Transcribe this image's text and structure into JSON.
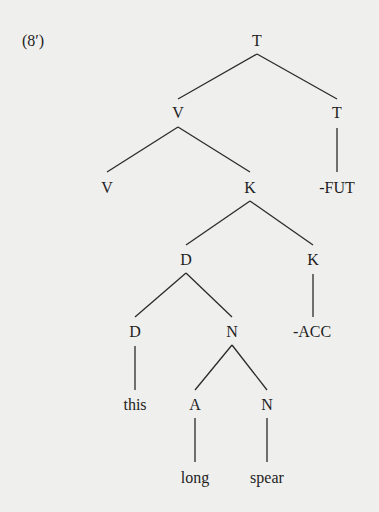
{
  "example": {
    "number": "(8′)"
  },
  "tree": {
    "nodes": [
      {
        "id": "t_root",
        "label": "T",
        "x": 257,
        "y": 41
      },
      {
        "id": "v_1",
        "label": "V",
        "x": 178,
        "y": 113
      },
      {
        "id": "t_2",
        "label": "T",
        "x": 337,
        "y": 113
      },
      {
        "id": "v_2",
        "label": "V",
        "x": 107,
        "y": 188
      },
      {
        "id": "k_1",
        "label": "K",
        "x": 250,
        "y": 188
      },
      {
        "id": "fut",
        "label": "-FUT",
        "x": 337,
        "y": 188
      },
      {
        "id": "d_1",
        "label": "D",
        "x": 186,
        "y": 260
      },
      {
        "id": "k_2",
        "label": "K",
        "x": 313,
        "y": 260
      },
      {
        "id": "d_2",
        "label": "D",
        "x": 135,
        "y": 332
      },
      {
        "id": "n_1",
        "label": "N",
        "x": 232,
        "y": 332
      },
      {
        "id": "acc",
        "label": "-ACC",
        "x": 312,
        "y": 332
      },
      {
        "id": "this",
        "label": "this",
        "x": 135,
        "y": 405
      },
      {
        "id": "a_1",
        "label": "A",
        "x": 195,
        "y": 405
      },
      {
        "id": "n_2",
        "label": "N",
        "x": 267,
        "y": 405
      },
      {
        "id": "long",
        "label": "long",
        "x": 195,
        "y": 478
      },
      {
        "id": "spear",
        "label": "spear",
        "x": 267,
        "y": 478
      }
    ],
    "edges": [
      [
        "t_root",
        "v_1"
      ],
      [
        "t_root",
        "t_2"
      ],
      [
        "v_1",
        "v_2"
      ],
      [
        "v_1",
        "k_1"
      ],
      [
        "t_2",
        "fut"
      ],
      [
        "k_1",
        "d_1"
      ],
      [
        "k_1",
        "k_2"
      ],
      [
        "d_1",
        "d_2"
      ],
      [
        "d_1",
        "n_1"
      ],
      [
        "k_2",
        "acc"
      ],
      [
        "d_2",
        "this"
      ],
      [
        "n_1",
        "a_1"
      ],
      [
        "n_1",
        "n_2"
      ],
      [
        "a_1",
        "long"
      ],
      [
        "n_2",
        "spear"
      ]
    ]
  }
}
